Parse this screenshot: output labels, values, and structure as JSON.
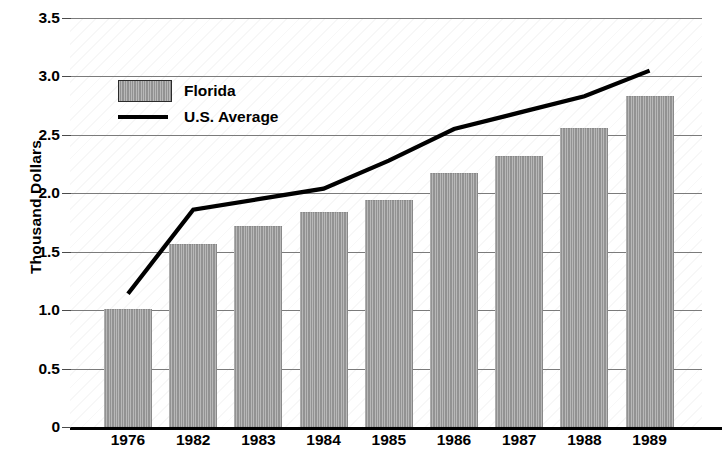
{
  "chart_data": {
    "type": "bar",
    "title": "",
    "subtitle": "",
    "xlabel": "",
    "ylabel": "Thousand Dollars",
    "categories": [
      "1976",
      "1982",
      "1983",
      "1984",
      "1985",
      "1986",
      "1987",
      "1988",
      "1989"
    ],
    "ylim": [
      0,
      3.5
    ],
    "ytick_labels": [
      "3.5",
      "3.0",
      "2.5",
      "2.0",
      "1.5",
      "1.0",
      "0.5",
      "0"
    ],
    "ytick_values": [
      3.5,
      3.0,
      2.5,
      2.0,
      1.5,
      1.0,
      0.5,
      0
    ],
    "grid": true,
    "grid_axis": "y",
    "legend_position": "upper-left-inside",
    "series": [
      {
        "name": "Florida",
        "type": "bar",
        "color": "#9a9a9a",
        "values": [
          1.01,
          1.57,
          1.72,
          1.84,
          1.94,
          2.17,
          2.32,
          2.56,
          2.83
        ]
      },
      {
        "name": "U.S. Average",
        "type": "line",
        "color": "#000000",
        "values": [
          1.14,
          1.86,
          1.95,
          2.04,
          2.28,
          2.55,
          2.69,
          2.83,
          3.05
        ]
      }
    ]
  },
  "legend": {
    "items": [
      {
        "label": "Florida",
        "marker": "bar-swatch-icon"
      },
      {
        "label": "U.S. Average",
        "marker": "line-swatch-icon"
      }
    ]
  },
  "axes": {
    "y_title": "Thousand Dollars"
  }
}
